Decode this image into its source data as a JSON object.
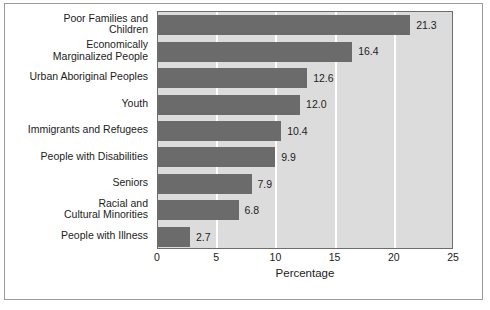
{
  "chart_data": {
    "type": "bar",
    "orientation": "horizontal",
    "title": "",
    "xlabel": "Percentage",
    "ylabel": "",
    "xlim": [
      0,
      25
    ],
    "xticks": [
      "0",
      "5",
      "10",
      "15",
      "20",
      "25"
    ],
    "grid": true,
    "legend": null,
    "categories": [
      "Poor Families and\nChildren",
      "Economically\nMarginalized People",
      "Urban Aboriginal Peoples",
      "Youth",
      "Immigrants and Refugees",
      "People with Disabilities",
      "Seniors",
      "Racial and\nCultural Minorities",
      "People with Illness"
    ],
    "values": [
      21.3,
      16.4,
      12.6,
      12.0,
      10.4,
      9.9,
      7.9,
      6.8,
      2.7
    ],
    "value_labels": [
      "21.3",
      "16.4",
      "12.6",
      "12.0",
      "10.4",
      "9.9",
      "7.9",
      "6.8",
      "2.7"
    ],
    "colors": {
      "bar": "#6b6b6b",
      "plot_background": "#dcdcdc",
      "gridline": "#ffffff",
      "axis": "#6d6d6d",
      "text": "#1c1c1c",
      "figure_border": "#9a9a9a",
      "figure_background": "#ffffff"
    }
  }
}
